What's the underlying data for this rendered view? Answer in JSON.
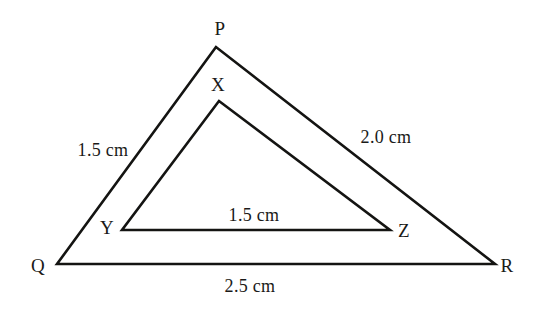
{
  "figure": {
    "type": "geometry-diagram",
    "background_color": "#ffffff",
    "stroke_color": "#141412",
    "text_color": "#1a1a18"
  },
  "shapes": [
    {
      "name": "outer-triangle",
      "vertices": [
        "P",
        "Q",
        "R"
      ],
      "points": "216,47 57,264 495,264",
      "stroke_width": 2.6
    },
    {
      "name": "inner-triangle",
      "vertices": [
        "X",
        "Y",
        "Z"
      ],
      "points": "219,101 122,230 390,230",
      "stroke_width": 2.6
    }
  ],
  "vertex_labels": [
    {
      "id": "P",
      "text": "P",
      "x": 220,
      "y": 28
    },
    {
      "id": "X",
      "text": "X",
      "x": 218,
      "y": 84
    },
    {
      "id": "Q",
      "text": "Q",
      "x": 38,
      "y": 265
    },
    {
      "id": "R",
      "text": "R",
      "x": 507,
      "y": 265
    },
    {
      "id": "Y",
      "text": "Y",
      "x": 107,
      "y": 227
    },
    {
      "id": "Z",
      "text": "Z",
      "x": 404,
      "y": 230
    }
  ],
  "measurement_labels": [
    {
      "id": "pq",
      "side": "PQ",
      "text": "1.5 cm",
      "value": 1.5,
      "unit": "cm",
      "x": 103,
      "y": 150
    },
    {
      "id": "pr",
      "side": "PR",
      "text": "2.0 cm",
      "value": 2.0,
      "unit": "cm",
      "x": 386,
      "y": 137
    },
    {
      "id": "yz",
      "side": "YZ",
      "text": "1.5 cm",
      "value": 1.5,
      "unit": "cm",
      "x": 254,
      "y": 215
    },
    {
      "id": "qr",
      "side": "QR",
      "text": "2.5 cm",
      "value": 2.5,
      "unit": "cm",
      "x": 250,
      "y": 286
    }
  ]
}
